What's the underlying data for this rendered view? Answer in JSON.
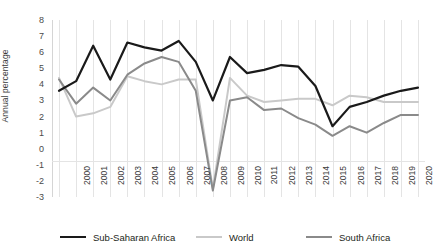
{
  "chart_data": {
    "type": "line",
    "title": "",
    "xlabel": "",
    "ylabel": "Annual percentage",
    "ylim": [
      -3,
      8
    ],
    "yticks": [
      8,
      7,
      6,
      5,
      4,
      3,
      2,
      1,
      0,
      -1,
      -2,
      -3
    ],
    "grid": "vertical-only",
    "legend_position": "bottom",
    "categories": [
      "2000",
      "2001",
      "2002",
      "2003",
      "2004",
      "2005",
      "2006",
      "2007",
      "2008",
      "2009",
      "2010",
      "2011",
      "2012",
      "2013",
      "2014",
      "2015",
      "2016",
      "2017",
      "2018",
      "2019",
      "2020",
      "2021"
    ],
    "series": [
      {
        "name": "Sub-Saharan Africa",
        "color": "#1a1a1a",
        "values": [
          3.6,
          4.2,
          6.4,
          4.3,
          6.6,
          6.3,
          6.1,
          6.7,
          5.4,
          3.0,
          5.7,
          4.7,
          4.9,
          5.2,
          5.1,
          3.9,
          1.4,
          2.6,
          2.9,
          3.3,
          3.6,
          3.8
        ]
      },
      {
        "name": "World",
        "color": "#c9c9c9",
        "values": [
          4.4,
          2.0,
          2.2,
          2.6,
          4.5,
          4.2,
          4.0,
          4.3,
          4.3,
          -2.5,
          4.4,
          3.3,
          2.9,
          3.0,
          3.1,
          3.1,
          2.7,
          3.3,
          3.2,
          2.9,
          2.9,
          2.9
        ]
      },
      {
        "name": "South Africa",
        "color": "#8a8a8a",
        "values": [
          4.3,
          2.8,
          3.8,
          3.0,
          4.6,
          5.3,
          5.7,
          5.4,
          3.6,
          -2.6,
          3.0,
          3.2,
          2.4,
          2.5,
          1.9,
          1.5,
          0.8,
          1.4,
          1.0,
          1.6,
          2.1,
          2.1
        ]
      }
    ]
  },
  "legend": [
    {
      "label": "Sub-Saharan Africa"
    },
    {
      "label": "World"
    },
    {
      "label": "South Africa"
    }
  ]
}
